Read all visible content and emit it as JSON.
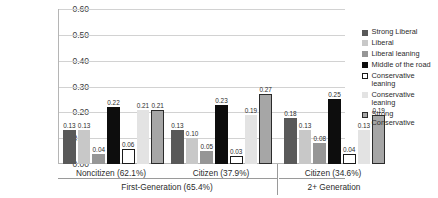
{
  "chart_data": {
    "type": "bar",
    "title": "",
    "xlabel": "",
    "ylabel": "",
    "ylim": [
      0.0,
      0.6
    ],
    "grid": true,
    "legend_position": "right",
    "ytick_labels": [
      "0.60",
      "0.50",
      "0.40",
      "0.30",
      "0.20",
      "0.10",
      "0.00"
    ],
    "ytick_values": [
      0.6,
      0.5,
      0.4,
      0.3,
      0.2,
      0.1,
      0.0
    ],
    "categories": [
      "Noncitizen (62.1%)",
      "Citizen (37.9%)",
      "Citizen (34.6%)"
    ],
    "group_headers": [
      "First-Generation (65.4%)",
      "2+ Generation"
    ],
    "series": [
      {
        "name": "Strong Liberal",
        "values": [
          0.13,
          0.13,
          0.18
        ],
        "labels": [
          "0.13",
          "0.13",
          "0.18"
        ],
        "fill": "#595959",
        "border": "#595959"
      },
      {
        "name": "Liberal",
        "values": [
          0.13,
          0.1,
          0.13
        ],
        "labels": [
          "0.13",
          "0.10",
          "0.13"
        ],
        "fill": "#c8c8c8",
        "border": "#c8c8c8"
      },
      {
        "name": "Liberal leaning",
        "values": [
          0.04,
          0.05,
          0.08
        ],
        "labels": [
          "0.04",
          "0.05",
          "0.08"
        ],
        "fill": "#969696",
        "border": "#969696"
      },
      {
        "name": "Middle of the road",
        "values": [
          0.22,
          0.23,
          0.25
        ],
        "labels": [
          "0.22",
          "0.23",
          "0.25"
        ],
        "fill": "#0d0d0d",
        "border": "#0d0d0d"
      },
      {
        "name": "Conservative leaning",
        "values": [
          0.06,
          0.03,
          0.04
        ],
        "labels": [
          "0.06",
          "0.03",
          "0.04"
        ],
        "fill": "#ffffff",
        "border": "#1a1a1a"
      },
      {
        "name": "Conservative leaning",
        "values": [
          0.21,
          0.19,
          0.13
        ],
        "labels": [
          "0.21",
          "0.19",
          "0.13"
        ],
        "fill": "#e3e3e3",
        "border": "#e3e3e3"
      },
      {
        "name": "Strong Conservative",
        "values": [
          0.21,
          0.27,
          0.19
        ],
        "labels": [
          "0.21",
          "0.27",
          "0.19"
        ],
        "fill": "#a6a6a6",
        "border": "#2b2b2b"
      }
    ]
  },
  "legend": {
    "items": [
      {
        "label": "Strong Liberal"
      },
      {
        "label": "Liberal"
      },
      {
        "label": "Liberal leaning"
      },
      {
        "label": "Middle of the road"
      },
      {
        "label": "Conservative leaning"
      },
      {
        "label": "Conservative leaning"
      },
      {
        "label": "Strong Conservative"
      }
    ]
  }
}
